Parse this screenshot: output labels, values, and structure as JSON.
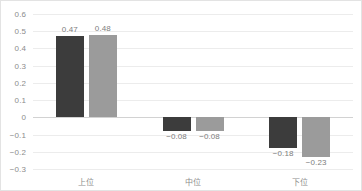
{
  "chart_data": {
    "type": "bar",
    "title": "",
    "subtitle": "",
    "xlabel": "",
    "ylabel": "",
    "categories": [
      "上位",
      "中位",
      "下位"
    ],
    "series": [
      {
        "name": "series-1",
        "color": "#3c3c3c",
        "values": [
          0.47,
          -0.08,
          -0.18
        ],
        "labels": [
          "0.47",
          "−0.08",
          "−0.18"
        ]
      },
      {
        "name": "series-2",
        "color": "#9b9b9b",
        "values": [
          0.48,
          -0.08,
          -0.23
        ],
        "labels": [
          "0.48",
          "−0.08",
          "−0.23"
        ]
      }
    ],
    "ylim": [
      -0.3,
      0.6
    ],
    "ytick_step": 0.1,
    "ytick_labels": [
      "0.6",
      "0.5",
      "0.4",
      "0.3",
      "0.2",
      "0.1",
      "0",
      "−0.1",
      "−0.2",
      "−0.3"
    ],
    "ytick_values": [
      0.6,
      0.5,
      0.4,
      0.3,
      0.2,
      0.1,
      0,
      -0.1,
      -0.2,
      -0.3
    ],
    "grid": "horizontal",
    "legend": "none",
    "zero_line": true,
    "colors": {
      "grid": "#ececec",
      "zero_line": "#d2d2d2",
      "tick_text": "#8c8c8c",
      "label_text": "#7d7d7d",
      "border": "#e3e3e3",
      "background": "#ffffff"
    }
  }
}
